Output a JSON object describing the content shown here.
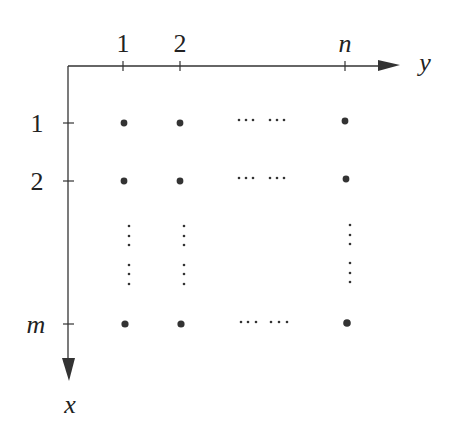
{
  "diagram": {
    "type": "grid-lattice",
    "colors": {
      "ink": "#222222",
      "background": "#ffffff"
    },
    "axes": {
      "horizontal": {
        "name": "y",
        "label": "y",
        "direction": "right"
      },
      "vertical": {
        "name": "x",
        "label": "x",
        "direction": "down"
      }
    },
    "column_ticks": [
      {
        "label": "1",
        "x": 123
      },
      {
        "label": "2",
        "x": 180
      },
      {
        "label": "n",
        "x": 345
      }
    ],
    "row_ticks": [
      {
        "label": "1",
        "y": 123
      },
      {
        "label": "2",
        "y": 181
      },
      {
        "label": "m",
        "y": 324
      }
    ],
    "ellipsis_horizontal": "⋯ ⋯",
    "ellipsis_vertical": "⋮"
  }
}
